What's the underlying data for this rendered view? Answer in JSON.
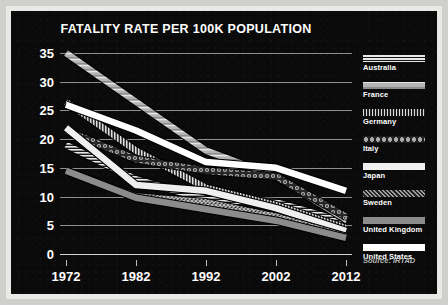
{
  "source_note": "Source: IRTAD",
  "colors": {
    "panel_background": "#0a0a0a",
    "gridline": "#8f8f8f",
    "axis": "#d4d4d4",
    "text": "#ffffff",
    "source_text": "#b9b9b9"
  },
  "chart_data": {
    "type": "line",
    "title": "FATALITY RATE PER 100K POPULATION",
    "xlabel": "",
    "ylabel": "",
    "x": [
      1972,
      1982,
      1992,
      2002,
      2012
    ],
    "categories": [
      "1972",
      "1982",
      "1992",
      "2002",
      "2012"
    ],
    "xlim": [
      1972,
      2012
    ],
    "ylim": [
      0,
      35
    ],
    "yticks": [
      0,
      5,
      10,
      15,
      20,
      25,
      30,
      35
    ],
    "ytick_labels": [
      "0",
      "5",
      "10",
      "15",
      "20",
      "25",
      "30",
      "35"
    ],
    "grid": true,
    "legend_position": "right",
    "annotations": [
      "Source: IRTAD"
    ],
    "series": [
      {
        "name": "Australia",
        "pattern": "double-stripe",
        "color": "#e8e8e8",
        "values": [
          19.0,
          13.0,
          9.5,
          9.0,
          5.5
        ]
      },
      {
        "name": "France",
        "pattern": "thick-gray-band",
        "color": "#c9c9c9",
        "values": [
          35.0,
          26.5,
          18.0,
          13.5,
          6.0
        ]
      },
      {
        "name": "Germany",
        "pattern": "vertical-hatch",
        "color": "#dcdcdc",
        "values": [
          26.5,
          18.0,
          11.5,
          8.5,
          4.5
        ]
      },
      {
        "name": "Italy",
        "pattern": "beaded-chain",
        "color": "#a8a8a8",
        "values": [
          21.5,
          16.5,
          14.5,
          13.5,
          6.5
        ]
      },
      {
        "name": "Japan",
        "pattern": "solid-light",
        "color": "#efefef",
        "values": [
          22.0,
          12.0,
          11.0,
          8.0,
          4.0
        ]
      },
      {
        "name": "Sweden",
        "pattern": "cross-hatch",
        "color": "#9e9e9e",
        "values": [
          14.5,
          10.0,
          9.0,
          6.5,
          3.0
        ]
      },
      {
        "name": "United Kingdom",
        "pattern": "solid-mid-gray",
        "color": "#8c8c8c",
        "values": [
          14.5,
          9.8,
          7.8,
          5.8,
          2.8
        ]
      },
      {
        "name": "United States",
        "pattern": "solid-white",
        "color": "#ffffff",
        "values": [
          26.0,
          21.5,
          16.0,
          15.0,
          11.0
        ]
      }
    ]
  }
}
